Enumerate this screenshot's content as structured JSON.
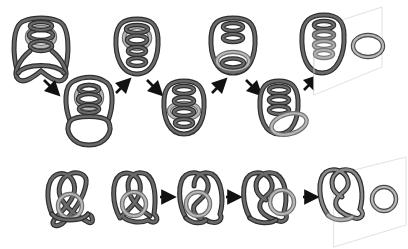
{
  "figure": {
    "colors": {
      "strand_dark": "#5a5a5a",
      "strand_outline": "#2e2e2e",
      "strand_light": "#a8a8a8",
      "strand_light_outline": "#6e6e6e",
      "arrow": "#111111",
      "plane": "#d9d9d9",
      "background": "#ffffff"
    }
  },
  "rows": [
    {
      "id": "top-row",
      "layout": "zigzag",
      "stages": [
        {
          "index": 1,
          "label": "",
          "type": "coil-with-ring-and-bottom-loops"
        },
        {
          "index": 2,
          "label": "",
          "type": "coil-with-ring-and-crossed-bottom"
        },
        {
          "index": 3,
          "label": "",
          "type": "coil-with-ring-inside"
        },
        {
          "index": 4,
          "label": "",
          "type": "coil-with-ring-lower"
        },
        {
          "index": 5,
          "label": "",
          "type": "coil-with-ring-at-bottom"
        },
        {
          "index": 6,
          "label": "",
          "type": "coil-on-plane-with-separated-ring"
        }
      ],
      "arrows": [
        {
          "from": 1,
          "to": 2,
          "direction": "down-right",
          "icon": "arrow-icon"
        },
        {
          "from": 2,
          "to": 3,
          "direction": "up-right",
          "icon": "arrow-icon"
        },
        {
          "from": 3,
          "to": 4,
          "direction": "down-right",
          "icon": "arrow-icon"
        },
        {
          "from": 4,
          "to": 5,
          "direction": "up-right",
          "icon": "arrow-icon"
        },
        {
          "from": 5,
          "to": 6,
          "direction": "down-right",
          "icon": "arrow-icon"
        },
        {
          "from": 6,
          "to": 7,
          "direction": "up-right",
          "icon": "arrow-icon"
        }
      ]
    },
    {
      "id": "bottom-row",
      "layout": "horizontal",
      "stages": [
        {
          "index": 1,
          "label": "",
          "type": "pretzel-knot-with-ring"
        },
        {
          "index": 2,
          "label": "",
          "type": "pretzel-knot-with-ring-shifted"
        },
        {
          "index": 3,
          "label": "",
          "type": "knot-with-ring-partially-untangled"
        },
        {
          "index": 4,
          "label": "",
          "type": "knot-with-ring-at-side"
        },
        {
          "index": 5,
          "label": "",
          "type": "knot-on-plane-with-separated-ring"
        }
      ],
      "arrows": [
        {
          "from": 2,
          "to": 3,
          "direction": "right",
          "icon": "arrow-icon"
        },
        {
          "from": 3,
          "to": 4,
          "direction": "right",
          "icon": "arrow-icon"
        },
        {
          "from": 4,
          "to": 5,
          "direction": "right",
          "icon": "arrow-icon"
        }
      ]
    }
  ]
}
